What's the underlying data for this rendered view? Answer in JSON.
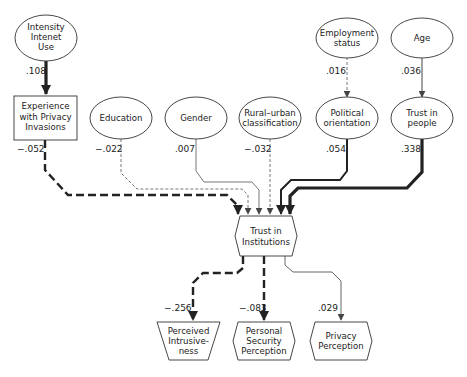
{
  "diagram": {
    "type": "path-model",
    "nodes": {
      "intensity": {
        "shape": "ellipse",
        "lines": [
          "Intensity",
          "Intenet",
          "Use"
        ]
      },
      "experience": {
        "shape": "rectangle",
        "lines": [
          "Experience",
          "with Privacy",
          "Invasions"
        ]
      },
      "education": {
        "shape": "ellipse",
        "lines": [
          "Education"
        ]
      },
      "gender": {
        "shape": "ellipse",
        "lines": [
          "Gender"
        ]
      },
      "rural": {
        "shape": "ellipse",
        "lines": [
          "Rural–urban",
          "classification"
        ]
      },
      "employment": {
        "shape": "ellipse",
        "lines": [
          "Employment",
          "status"
        ]
      },
      "political": {
        "shape": "ellipse",
        "lines": [
          "Political",
          "orientation"
        ]
      },
      "age": {
        "shape": "ellipse",
        "lines": [
          "Age"
        ]
      },
      "trust_people": {
        "shape": "ellipse",
        "lines": [
          "Trust in",
          "people"
        ]
      },
      "trust_institutions": {
        "shape": "hexagon",
        "lines": [
          "Trust in",
          "Institutions"
        ]
      },
      "perceived": {
        "shape": "trapezoid",
        "lines": [
          "Perceived",
          "Intrusive-",
          "ness"
        ]
      },
      "personal": {
        "shape": "hexagon",
        "lines": [
          "Personal",
          "Security",
          "Perception"
        ]
      },
      "privacy": {
        "shape": "hexagon",
        "lines": [
          "Privacy",
          "Perception"
        ]
      }
    },
    "edges": {
      "intensity_experience": {
        "from": "intensity",
        "to": "experience",
        "coef": ".108",
        "style": "solid-thick"
      },
      "experience_trust": {
        "from": "experience",
        "to": "trust_institutions",
        "coef": "−.052",
        "style": "dashed-thick"
      },
      "education_trust": {
        "from": "education",
        "to": "trust_institutions",
        "coef": "−.022",
        "style": "dashed-thin"
      },
      "gender_trust": {
        "from": "gender",
        "to": "trust_institutions",
        "coef": ".007",
        "style": "solid-thin"
      },
      "rural_trust": {
        "from": "rural",
        "to": "trust_institutions",
        "coef": "−.032",
        "style": "dashed-thin"
      },
      "employment_political": {
        "from": "employment",
        "to": "political",
        "coef": ".016",
        "style": "dashed-thin"
      },
      "political_trust": {
        "from": "political",
        "to": "trust_institutions",
        "coef": ".054",
        "style": "solid-medium"
      },
      "age_trustpeople": {
        "from": "age",
        "to": "trust_people",
        "coef": ".036",
        "style": "solid-thin"
      },
      "trustpeople_trust": {
        "from": "trust_people",
        "to": "trust_institutions",
        "coef": ".338",
        "style": "solid-thick"
      },
      "trust_perceived": {
        "from": "trust_institutions",
        "to": "perceived",
        "coef": "−.256",
        "style": "dashed-thick"
      },
      "trust_personal": {
        "from": "trust_institutions",
        "to": "personal",
        "coef": "−.083",
        "style": "dashed-thick"
      },
      "trust_privacy": {
        "from": "trust_institutions",
        "to": "privacy",
        "coef": ".029",
        "style": "solid-thin"
      }
    },
    "colors": {
      "line": "#2a2a2a",
      "thin_line": "#555555",
      "background": "#ffffff"
    }
  }
}
